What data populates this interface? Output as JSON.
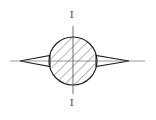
{
  "diagram": {
    "type": "cross-section",
    "section_label_top": "I",
    "section_label_bottom": "I",
    "circle": {
      "cx": 73,
      "cy": 61,
      "r": 24,
      "hatched": true
    },
    "stroke_color": "#222222",
    "hatch_color": "#444444"
  }
}
